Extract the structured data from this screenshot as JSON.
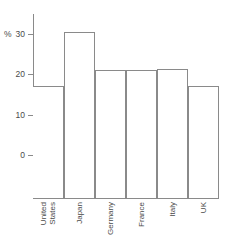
{
  "chart_data": {
    "type": "bar",
    "title": "",
    "subtitle": "",
    "xlabel": "",
    "ylabel": "%",
    "categories": [
      "United\nStates",
      "Japan",
      "Germany",
      "France",
      "Italy",
      "UK"
    ],
    "category_labels_flat": [
      "United States",
      "Japan",
      "Germany",
      "France",
      "Italy",
      "UK"
    ],
    "values": [
      17,
      30.5,
      21,
      21,
      21.3,
      17
    ],
    "ylim": [
      0,
      33
    ],
    "yticks": [
      0,
      10,
      20,
      30
    ],
    "ytick_labels": [
      "0",
      "10",
      "20",
      "30"
    ],
    "grid": false,
    "legend": "none",
    "bar_fill": "#ffffff",
    "bar_stroke": "#8a8a8a",
    "axis_color": "#8a8a8a",
    "text_color": "#4a4a4a",
    "xtick_rotation": -90
  }
}
